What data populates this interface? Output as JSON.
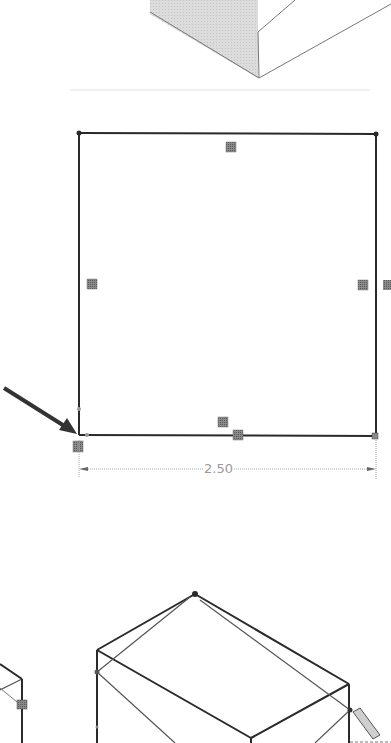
{
  "figure": {
    "panels": [
      {
        "id": "top",
        "description": "Shaded isometric solid (partial, cropped at top)"
      },
      {
        "id": "middle",
        "description": "Square sketch with sketch relation markers and horizontal dimension"
      },
      {
        "id": "bottom",
        "description": "Isometric wireframe box (partial, cropped at bottom)"
      }
    ],
    "dimension": {
      "value": "2.50",
      "orientation": "horizontal"
    },
    "callout": {
      "type": "arrow",
      "target": "bottom-left corner of square (origin)"
    },
    "colors": {
      "line": "#2a2a2a",
      "shade": "#d8d8d8",
      "marker": "#7a7a7a",
      "dimension": "#9a9a9a"
    }
  }
}
